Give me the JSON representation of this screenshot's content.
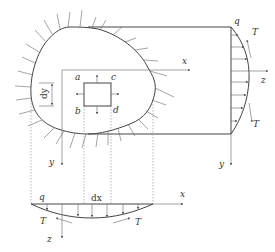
{
  "diagram": {
    "type": "elastic body cross-section with stress distribution projections",
    "colors": {
      "line": "#444444",
      "text": "#333333",
      "background": "#ffffff"
    },
    "main_view": {
      "axes": {
        "x_label": "x",
        "y_label": "y"
      },
      "element_corners": [
        "a",
        "c",
        "b",
        "d"
      ],
      "dimension_label": "dy"
    },
    "side_view": {
      "axes": {
        "z_label": "z",
        "y_label": "y"
      },
      "load_label": "q",
      "shear_top_label": "T",
      "shear_bottom_label": "T"
    },
    "bottom_view": {
      "axes": {
        "x_label": "x",
        "z_label": "z"
      },
      "load_label": "q",
      "dimension_label": "dx",
      "shear_left_label": "T",
      "shear_right_label": "T"
    }
  }
}
